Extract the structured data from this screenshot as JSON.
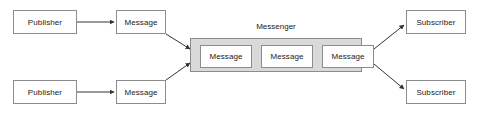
{
  "diagram": {
    "colors": {
      "node_fill": "#ffffff",
      "node_stroke": "#8c8c8c",
      "container_fill": "#d9d9d9",
      "edge_stroke": "#333333",
      "background": "#ffffff",
      "text": "#1a1a1a"
    },
    "publishers": [
      {
        "label": "Publisher"
      },
      {
        "label": "Publisher"
      }
    ],
    "publisher_messages": [
      {
        "label": "Message"
      },
      {
        "label": "Message"
      }
    ],
    "messenger": {
      "label": "Messenger",
      "messages": [
        {
          "label": "Message"
        },
        {
          "label": "Message"
        },
        {
          "label": "Message"
        }
      ]
    },
    "subscribers": [
      {
        "label": "Subscriber"
      },
      {
        "label": "Subscriber"
      }
    ]
  }
}
